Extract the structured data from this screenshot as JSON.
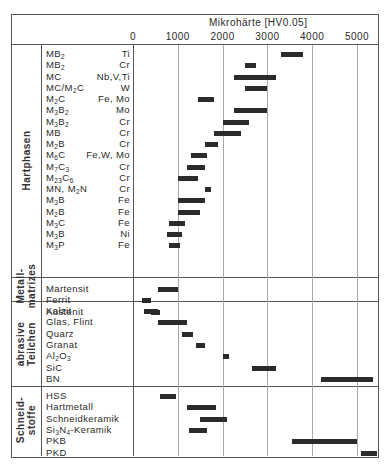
{
  "chart_data": {
    "type": "bar",
    "subtype": "horizontal-range",
    "title": "",
    "xlabel": "Mikrohärte [HV0.05]",
    "ylabel": "",
    "xlim": [
      0,
      5300
    ],
    "x_ticks": [
      "0",
      "1000",
      "2000",
      "3000",
      "4000",
      "5000"
    ],
    "grid": true,
    "legend": null,
    "groups": [
      {
        "name": "Hartphasen",
        "rows": [
          {
            "label": "MB2",
            "html": "MB<sub>2</sub>",
            "element": "Ti",
            "min": 3300,
            "max": 3800
          },
          {
            "label": "MB2",
            "html": "MB<sub>2</sub>",
            "element": "Cr",
            "min": 2500,
            "max": 2750
          },
          {
            "label": "MC",
            "html": "MC",
            "element": "Nb,V,Ti",
            "min": 2250,
            "max": 3200
          },
          {
            "label": "MC/M2C",
            "html": "MC/M<sub>2</sub>C",
            "element": "W",
            "min": 2500,
            "max": 3000
          },
          {
            "label": "M2C",
            "html": "M<sub>2</sub>C",
            "element": "Fe, Mo",
            "min": 1450,
            "max": 1800
          },
          {
            "label": "M3B2",
            "html": "M<sub>3</sub>B<sub>2</sub>",
            "element": "Mo",
            "min": 2250,
            "max": 3000
          },
          {
            "label": "M3B2",
            "html": "M<sub>3</sub>B<sub>2</sub>",
            "element": "Cr",
            "min": 2000,
            "max": 2600
          },
          {
            "label": "MB",
            "html": "MB",
            "element": "Cr",
            "min": 1800,
            "max": 2400
          },
          {
            "label": "M2B",
            "html": "M<sub>2</sub>B",
            "element": "Cr",
            "min": 1600,
            "max": 1900
          },
          {
            "label": "M6C",
            "html": "M<sub>6</sub>C",
            "element": "Fe,W, Mo",
            "min": 1300,
            "max": 1650
          },
          {
            "label": "M7C3",
            "html": "M<sub>7</sub>C<sub>3</sub>",
            "element": "Cr",
            "min": 1200,
            "max": 1600
          },
          {
            "label": "M23C6",
            "html": "M<sub>23</sub>C<sub>6</sub>",
            "element": "Cr",
            "min": 1000,
            "max": 1450
          },
          {
            "label": "MN, M2N",
            "html": "MN, M<sub>2</sub>N",
            "element": "Cr",
            "min": 1600,
            "max": 1750
          },
          {
            "label": "M3B",
            "html": "M<sub>3</sub>B",
            "element": "Fe",
            "min": 1000,
            "max": 1600
          },
          {
            "label": "M2B",
            "html": "M<sub>2</sub>B",
            "element": "Fe",
            "min": 1000,
            "max": 1500
          },
          {
            "label": "M3C",
            "html": "M<sub>3</sub>C",
            "element": "Fe",
            "min": 800,
            "max": 1150
          },
          {
            "label": "M3B",
            "html": "M<sub>3</sub>B",
            "element": "Ni",
            "min": 750,
            "max": 1100
          },
          {
            "label": "M3P",
            "html": "M<sub>3</sub>P",
            "element": "Fe",
            "min": 800,
            "max": 1050
          }
        ]
      },
      {
        "name": "Metall-matrizes",
        "rows": [
          {
            "label": "Martensit",
            "html": "Martensit",
            "element": "",
            "min": 550,
            "max": 1000
          },
          {
            "label": "Ferrit",
            "html": "Ferrit",
            "element": "",
            "min": 200,
            "max": 400
          },
          {
            "label": "Austenit",
            "html": "Austenit",
            "element": "",
            "min": 400,
            "max": 600
          }
        ]
      },
      {
        "name": "abrasive Teilchen",
        "rows": [
          {
            "label": "Kalzit",
            "html": "Kalzit",
            "element": "",
            "min": 250,
            "max": 550
          },
          {
            "label": "Glas, Flint",
            "html": "Glas, Flint",
            "element": "",
            "min": 550,
            "max": 1200
          },
          {
            "label": "Quarz",
            "html": "Quarz",
            "element": "",
            "min": 1100,
            "max": 1350
          },
          {
            "label": "Granat",
            "html": "Granat",
            "element": "",
            "min": 1400,
            "max": 1600
          },
          {
            "label": "Al2O3",
            "html": "Al<sub>2</sub>O<sub>3</sub>",
            "element": "",
            "min": 2000,
            "max": 2150
          },
          {
            "label": "SiC",
            "html": "SiC",
            "element": "",
            "min": 2650,
            "max": 3200
          },
          {
            "label": "BN",
            "html": "BN",
            "element": "",
            "min": 4200,
            "max": 5350
          }
        ]
      },
      {
        "name": "Schneid-stoffe",
        "rows": [
          {
            "label": "HSS",
            "html": "HSS",
            "element": "",
            "min": 600,
            "max": 950
          },
          {
            "label": "Hartmetall",
            "html": "Hartmetall",
            "element": "",
            "min": 1200,
            "max": 1850
          },
          {
            "label": "Schneidkeramik",
            "html": "Schneidkeramik",
            "element": "",
            "min": 1500,
            "max": 2100
          },
          {
            "label": "Si3N4-Keramik",
            "html": "Si<sub>3</sub>N<sub>4</sub>-Keramik",
            "element": "",
            "min": 1250,
            "max": 1650
          },
          {
            "label": "PKB",
            "html": "PKB",
            "element": "",
            "min": 3550,
            "max": 5000
          },
          {
            "label": "PKD",
            "html": "PKD",
            "element": "",
            "min": 5100,
            "max": 5500
          }
        ]
      }
    ]
  },
  "header": {
    "axis_title": "Mikrohärte [HV0.05]",
    "ticks": [
      "0",
      "1000",
      "2000",
      "3000",
      "4000",
      "5000"
    ]
  },
  "groups_labels": {
    "g0_line1": "Hartphasen",
    "g1_line1": "Metall-",
    "g1_line2": "matrizes",
    "g2_line1": "abrasive",
    "g2_line2": "Teilchen",
    "g3_line1": "Schneid-",
    "g3_line2": "stoffe"
  },
  "colors": {
    "bar": "#2b2b2b",
    "frame": "#555555",
    "grid": "#aaaaaa"
  }
}
